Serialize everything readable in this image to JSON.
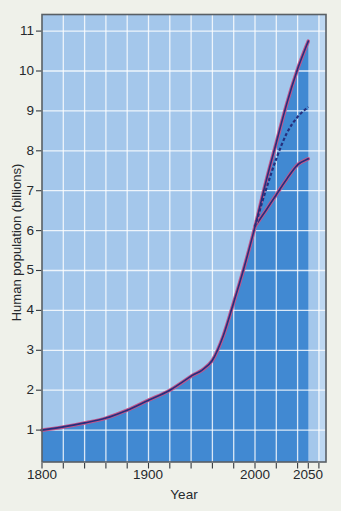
{
  "figure": {
    "y_axis_title": "Human population (billions)",
    "x_axis_title": "Year",
    "y_tick_labels": [
      "11",
      "10",
      "9",
      "8",
      "7",
      "6",
      "5",
      "4",
      "3",
      "2",
      "1"
    ],
    "x_tick_labels": [
      "1800",
      "1900",
      "2000",
      "2050"
    ]
  },
  "colors": {
    "outer_bg": "#eff1ea",
    "plot_bg": "#a4c7eb",
    "plot_bg_light": "#bed8f2",
    "area_fill": "#4189d2",
    "gridline": "rgba(255,255,255,0.8)",
    "curve_outline": "#c2558b",
    "curve_core": "#262f7d",
    "border": "#596065",
    "tick": "#343a40",
    "text": "#26292d"
  },
  "chart_data": {
    "type": "area",
    "title": "",
    "xlabel": "Year",
    "ylabel": "Human population (billions)",
    "xlim": [
      1800,
      2067
    ],
    "ylim": [
      0,
      11.4
    ],
    "x_labeled_ticks": [
      1800,
      1900,
      2000,
      2050
    ],
    "x_ticks_years": [
      1800,
      1820,
      1840,
      1860,
      1880,
      1900,
      1920,
      1940,
      1960,
      1980,
      2000,
      2020,
      2040,
      2050,
      2060
    ],
    "y_ticks": [
      1,
      2,
      3,
      4,
      5,
      6,
      7,
      8,
      9,
      10,
      11
    ],
    "grid": true,
    "area_fill_under": "historical curve plus high projection, 1800-2050",
    "series": [
      {
        "name": "historical",
        "label": "Historical population",
        "line": "solid dark blue with pink outline",
        "x": [
          1800,
          1820,
          1840,
          1860,
          1880,
          1900,
          1920,
          1940,
          1950,
          1960,
          1970,
          1980,
          1990,
          2000
        ],
        "values": [
          1.0,
          1.08,
          1.18,
          1.3,
          1.5,
          1.75,
          2.0,
          2.35,
          2.5,
          2.75,
          3.35,
          4.2,
          5.1,
          6.1
        ]
      },
      {
        "name": "high",
        "label": "High projection",
        "line": "solid dark blue with pink outline",
        "x": [
          2000,
          2010,
          2020,
          2030,
          2040,
          2050
        ],
        "values": [
          6.1,
          7.2,
          8.2,
          9.2,
          10.05,
          10.75
        ]
      },
      {
        "name": "medium",
        "label": "Medium projection",
        "line": "dashed dark blue",
        "x": [
          2000,
          2010,
          2020,
          2030,
          2040,
          2050
        ],
        "values": [
          6.1,
          7.0,
          7.8,
          8.45,
          8.85,
          9.1
        ]
      },
      {
        "name": "low",
        "label": "Low projection",
        "line": "solid dark blue with pink outline",
        "x": [
          2000,
          2010,
          2020,
          2030,
          2040,
          2050
        ],
        "values": [
          6.1,
          6.5,
          6.9,
          7.3,
          7.65,
          7.8
        ]
      }
    ]
  }
}
